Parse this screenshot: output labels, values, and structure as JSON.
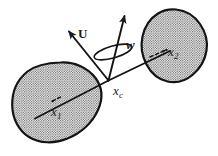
{
  "figure": {
    "type": "vector-diagram",
    "background_color": "#ffffff",
    "ink_color": "#1a1a1a",
    "stipple_color": "#4a4a4a",
    "labels": {
      "vector_u": "U",
      "vector_w": "w",
      "center_point": "x",
      "center_point_subscript": "c",
      "body_one": "x",
      "body_one_subscript": "1",
      "body_two": "x",
      "body_two_subscript": "2"
    },
    "bodies": [
      {
        "name": "left-body",
        "label": "x1",
        "center": [
          62,
          102
        ],
        "fill": "stipple"
      },
      {
        "name": "right-body",
        "label": "x2",
        "center": [
          175,
          45
        ],
        "fill": "stipple"
      }
    ],
    "vectors": [
      {
        "name": "u-arrow",
        "label": "U",
        "from": [
          108,
          80
        ],
        "to": [
          66,
          28
        ],
        "style": "solid-filled-arrowhead"
      },
      {
        "name": "w-arrow",
        "label": "w",
        "from": [
          108,
          80
        ],
        "to": [
          126,
          12
        ],
        "style": "solid-filled-arrowhead"
      }
    ],
    "connector": {
      "name": "body-axis-line",
      "from": [
        35,
        117
      ],
      "through": [
        108,
        80
      ],
      "to": [
        168,
        52
      ]
    },
    "rotation_indicator": {
      "name": "rotation-ellipse",
      "center": [
        113,
        52
      ],
      "rx": 19,
      "ry": 6,
      "rotation_deg": -18
    }
  }
}
